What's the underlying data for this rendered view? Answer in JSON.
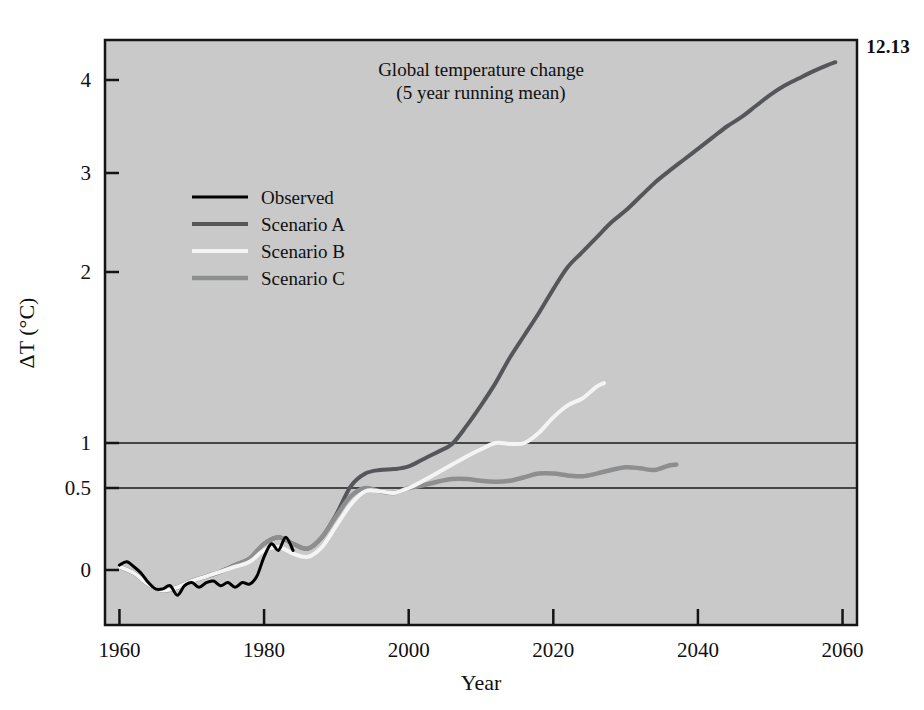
{
  "figure": {
    "number_label": "12.13",
    "background_color": "#ffffff",
    "plot_background_color": "#c9c9c9"
  },
  "chart_data": {
    "type": "line",
    "title": "Global temperature change",
    "subtitle": "(5 year running mean)",
    "xlabel": "Year",
    "ylabel": "ΔT (°C)",
    "xlim": [
      1958,
      2062
    ],
    "ylim": [
      -0.35,
      4.45
    ],
    "xticks": [
      1960,
      1980,
      2000,
      2020,
      2040,
      2060
    ],
    "xticklabels": [
      "1960",
      "1980",
      "2000",
      "2020",
      "2040",
      "2060"
    ],
    "yticks": [
      0,
      0.5,
      1,
      2,
      3,
      4
    ],
    "yticklabels": [
      "0",
      "0.5",
      "1",
      "2",
      "3",
      "4"
    ],
    "gridlines_y": [
      0.5,
      1
    ],
    "grid": "horizontal-partial",
    "legend_position": "upper-left-inside",
    "series": [
      {
        "name": "Observed",
        "color": "#000000",
        "width": 3.0,
        "x": [
          1960,
          1961,
          1962,
          1963,
          1964,
          1965,
          1966,
          1967,
          1968,
          1969,
          1970,
          1971,
          1972,
          1973,
          1974,
          1975,
          1976,
          1977,
          1978,
          1979,
          1980,
          1981,
          1982,
          1983,
          1984
        ],
        "values": [
          0.03,
          0.05,
          0.02,
          -0.02,
          -0.08,
          -0.12,
          -0.12,
          -0.1,
          -0.16,
          -0.1,
          -0.08,
          -0.11,
          -0.08,
          -0.07,
          -0.1,
          -0.08,
          -0.11,
          -0.08,
          -0.09,
          -0.04,
          0.08,
          0.16,
          0.12,
          0.2,
          0.12
        ]
      },
      {
        "name": "Scenario A",
        "color": "#55565a",
        "width": 4.0,
        "x": [
          1960,
          1962,
          1964,
          1966,
          1968,
          1970,
          1972,
          1974,
          1976,
          1978,
          1980,
          1982,
          1984,
          1986,
          1988,
          1990,
          1992,
          1994,
          1996,
          1998,
          2000,
          2002,
          2004,
          2006,
          2008,
          2010,
          2012,
          2014,
          2016,
          2018,
          2020,
          2022,
          2024,
          2026,
          2028,
          2030,
          2032,
          2034,
          2036,
          2038,
          2040,
          2042,
          2044,
          2046,
          2048,
          2050,
          2052,
          2054,
          2056,
          2058,
          2059
        ],
        "values": [
          0.02,
          -0.02,
          -0.09,
          -0.13,
          -0.11,
          -0.07,
          -0.04,
          -0.01,
          0.03,
          0.07,
          0.16,
          0.2,
          0.16,
          0.13,
          0.2,
          0.34,
          0.52,
          0.66,
          0.7,
          0.71,
          0.74,
          0.82,
          0.9,
          0.99,
          1.1,
          1.22,
          1.35,
          1.5,
          1.63,
          1.76,
          1.9,
          2.05,
          2.2,
          2.35,
          2.5,
          2.62,
          2.76,
          2.9,
          3.02,
          3.14,
          3.26,
          3.38,
          3.5,
          3.6,
          3.72,
          3.84,
          3.94,
          4.02,
          4.1,
          4.17,
          4.2
        ]
      },
      {
        "name": "Scenario B",
        "color": "#f4f4f4",
        "width": 4.0,
        "x": [
          1960,
          1962,
          1964,
          1966,
          1968,
          1970,
          1972,
          1974,
          1976,
          1978,
          1980,
          1982,
          1984,
          1986,
          1988,
          1990,
          1992,
          1994,
          1996,
          1998,
          2000,
          2002,
          2004,
          2006,
          2008,
          2010,
          2012,
          2014,
          2016,
          2018,
          2020,
          2022,
          2024,
          2026,
          2027
        ],
        "values": [
          0.02,
          -0.02,
          -0.09,
          -0.13,
          -0.11,
          -0.07,
          -0.04,
          -0.01,
          0.02,
          0.05,
          0.12,
          0.14,
          0.1,
          0.08,
          0.14,
          0.27,
          0.4,
          0.48,
          0.48,
          0.47,
          0.5,
          0.58,
          0.67,
          0.76,
          0.85,
          0.93,
          1.0,
          0.99,
          1.0,
          1.06,
          1.15,
          1.22,
          1.26,
          1.33,
          1.35
        ]
      },
      {
        "name": "Scenario C",
        "color": "#8d8e90",
        "width": 4.5,
        "x": [
          1960,
          1962,
          1964,
          1966,
          1968,
          1970,
          1972,
          1974,
          1976,
          1978,
          1980,
          1982,
          1984,
          1986,
          1988,
          1990,
          1992,
          1994,
          1996,
          1998,
          2000,
          2002,
          2004,
          2006,
          2008,
          2010,
          2012,
          2014,
          2016,
          2018,
          2020,
          2022,
          2024,
          2026,
          2028,
          2030,
          2032,
          2034,
          2036,
          2037
        ],
        "values": [
          0.02,
          -0.02,
          -0.09,
          -0.13,
          -0.11,
          -0.07,
          -0.04,
          -0.01,
          0.03,
          0.07,
          0.16,
          0.2,
          0.16,
          0.13,
          0.2,
          0.33,
          0.45,
          0.5,
          0.48,
          0.47,
          0.5,
          0.53,
          0.57,
          0.6,
          0.6,
          0.58,
          0.57,
          0.58,
          0.62,
          0.66,
          0.66,
          0.64,
          0.63,
          0.66,
          0.7,
          0.73,
          0.72,
          0.7,
          0.75,
          0.76
        ]
      }
    ]
  }
}
